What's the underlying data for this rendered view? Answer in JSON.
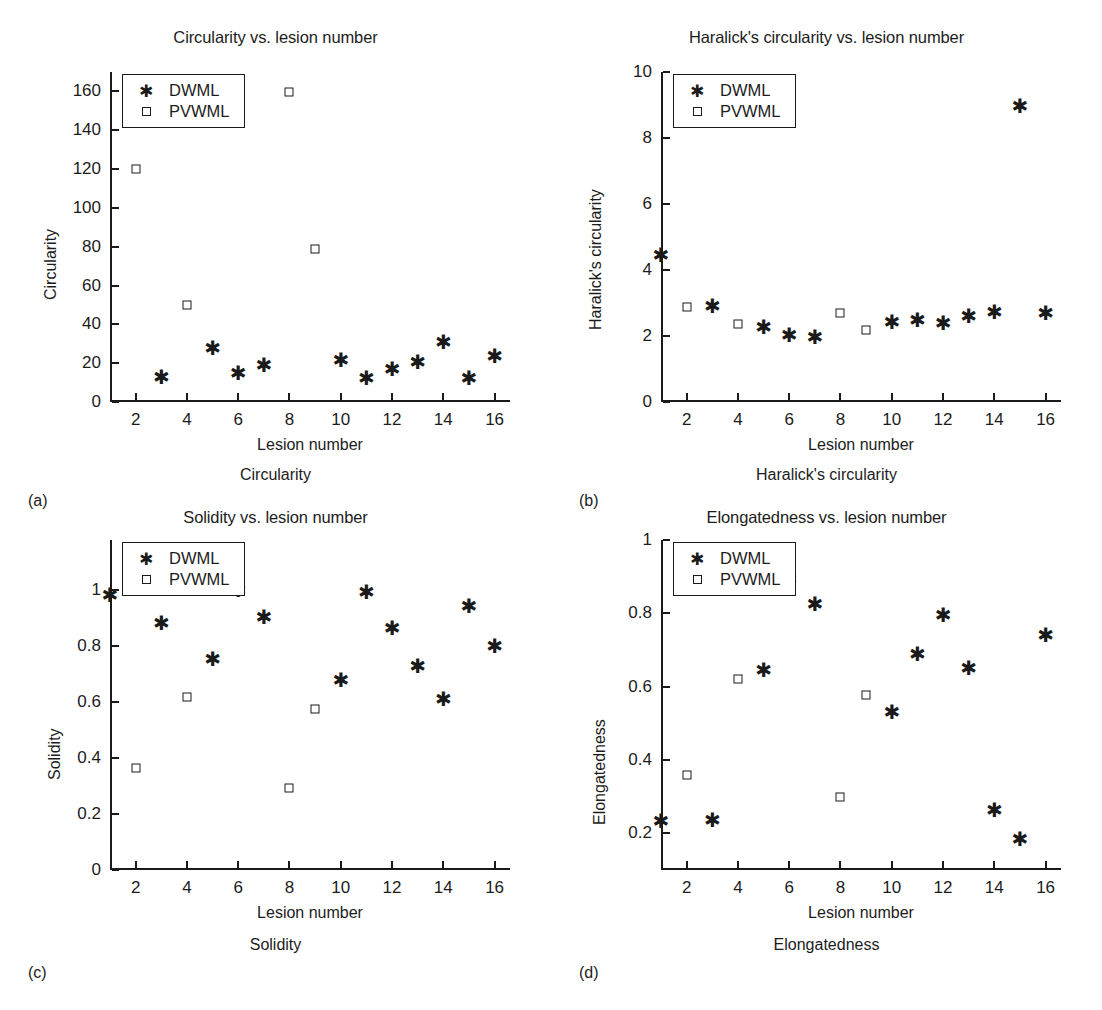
{
  "figure": {
    "series_labels": [
      "DWML",
      "PVWML"
    ],
    "marker_dwml": "star-marker",
    "marker_pvwml": "square-marker",
    "ink_color": "#1a1a1a",
    "background": "#ffffff"
  },
  "panels": [
    {
      "letter": "(a)",
      "caption": "Circularity",
      "chart_data": {
        "type": "scatter",
        "title": "Circularity vs. lesion number",
        "xlabel": "Lesion number",
        "ylabel": "Circularity",
        "xlim": [
          1,
          16.6
        ],
        "ylim": [
          0,
          170
        ],
        "xticks": [
          2,
          4,
          6,
          8,
          10,
          12,
          14,
          16
        ],
        "yticks": [
          0,
          20,
          40,
          60,
          80,
          100,
          120,
          140,
          160
        ],
        "grid": false,
        "legend_position": "top-left",
        "series": [
          {
            "name": "DWML",
            "marker": "star",
            "points": [
              [
                3,
                13
              ],
              [
                5,
                28
              ],
              [
                6,
                15
              ],
              [
                7,
                19
              ],
              [
                10,
                21.5
              ],
              [
                11,
                12.5
              ],
              [
                12,
                17
              ],
              [
                13,
                20.5
              ],
              [
                14,
                31
              ],
              [
                15,
                12.5
              ],
              [
                16,
                23.5
              ]
            ]
          },
          {
            "name": "PVWML",
            "marker": "square",
            "points": [
              [
                2,
                120
              ],
              [
                4,
                50
              ],
              [
                8,
                159.5
              ],
              [
                9,
                79
              ]
            ]
          }
        ]
      }
    },
    {
      "letter": "(b)",
      "caption": "Haralick's circularity",
      "chart_data": {
        "type": "scatter",
        "title": "Haralick's circularity vs. lesion number",
        "xlabel": "Lesion number",
        "ylabel": "Haralick's circularity",
        "xlim": [
          1,
          16.6
        ],
        "ylim": [
          0,
          10
        ],
        "xticks": [
          2,
          4,
          6,
          8,
          10,
          12,
          14,
          16
        ],
        "yticks": [
          0,
          2,
          4,
          6,
          8,
          10
        ],
        "grid": false,
        "legend_position": "top-left",
        "series": [
          {
            "name": "DWML",
            "marker": "star",
            "points": [
              [
                1,
                4.45
              ],
              [
                3,
                2.9
              ],
              [
                5,
                2.28
              ],
              [
                6,
                2.02
              ],
              [
                7,
                1.97
              ],
              [
                10,
                2.42
              ],
              [
                11,
                2.48
              ],
              [
                12,
                2.4
              ],
              [
                13,
                2.62
              ],
              [
                14,
                2.73
              ],
              [
                15,
                8.97
              ],
              [
                16,
                2.7
              ]
            ]
          },
          {
            "name": "PVWML",
            "marker": "square",
            "points": [
              [
                2,
                2.87
              ],
              [
                4,
                2.35
              ],
              [
                8,
                2.7
              ],
              [
                9,
                2.17
              ]
            ]
          }
        ]
      }
    },
    {
      "letter": "(c)",
      "caption": "Solidity",
      "chart_data": {
        "type": "scatter",
        "title": "Solidity vs. lesion number",
        "xlabel": "Lesion number",
        "ylabel": "Solidity",
        "xlim": [
          1,
          16.6
        ],
        "ylim": [
          0,
          1.18
        ],
        "xticks": [
          2,
          4,
          6,
          8,
          10,
          12,
          14,
          16
        ],
        "yticks": [
          0,
          0.2,
          0.4,
          0.6,
          0.8,
          1
        ],
        "grid": false,
        "legend_position": "top-left",
        "series": [
          {
            "name": "DWML",
            "marker": "star",
            "points": [
              [
                1,
                0.985
              ],
              [
                3,
                0.885
              ],
              [
                5,
                0.755
              ],
              [
                6,
                1.0
              ],
              [
                7,
                0.905
              ],
              [
                10,
                0.68
              ],
              [
                11,
                0.995
              ],
              [
                12,
                0.865
              ],
              [
                13,
                0.73
              ],
              [
                14,
                0.61
              ],
              [
                15,
                0.945
              ],
              [
                16,
                0.8
              ]
            ]
          },
          {
            "name": "PVWML",
            "marker": "square",
            "points": [
              [
                2,
                0.365
              ],
              [
                4,
                0.62
              ],
              [
                8,
                0.295
              ],
              [
                9,
                0.575
              ]
            ]
          }
        ]
      }
    },
    {
      "letter": "(d)",
      "caption": "Elongatedness",
      "chart_data": {
        "type": "scatter",
        "title": "Elongatedness vs. lesion number",
        "xlabel": "Lesion number",
        "ylabel": "Elongatedness",
        "xlim": [
          1,
          16.6
        ],
        "ylim": [
          0.1,
          1
        ],
        "xticks": [
          2,
          4,
          6,
          8,
          10,
          12,
          14,
          16
        ],
        "yticks": [
          0.2,
          0.4,
          0.6,
          0.8,
          1
        ],
        "grid": false,
        "legend_position": "top-left",
        "series": [
          {
            "name": "DWML",
            "marker": "star",
            "points": [
              [
                1,
                0.235
              ],
              [
                3,
                0.237
              ],
              [
                5,
                0.645
              ],
              [
                6,
                0.895
              ],
              [
                7,
                0.825
              ],
              [
                10,
                0.53
              ],
              [
                11,
                0.69
              ],
              [
                12,
                0.795
              ],
              [
                13,
                0.65
              ],
              [
                14,
                0.265
              ],
              [
                15,
                0.185
              ],
              [
                16,
                0.74
              ]
            ]
          },
          {
            "name": "PVWML",
            "marker": "square",
            "points": [
              [
                2,
                0.36
              ],
              [
                4,
                0.62
              ],
              [
                8,
                0.3
              ],
              [
                9,
                0.578
              ]
            ]
          }
        ]
      }
    }
  ]
}
